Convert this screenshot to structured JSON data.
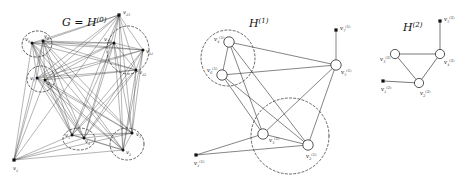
{
  "figure": {
    "type": "graph-coarsening-diagram",
    "panel_count": 3,
    "background": "#ffffff",
    "ink_color": "#1a1a1a"
  },
  "panels": [
    {
      "id": "panel-0",
      "title": "G = H",
      "title_sup": "(0)",
      "title_full": "G = H^(0)",
      "title_pos": {
        "x": 62,
        "y": 26
      },
      "vertex_count": 13,
      "vertices": [
        {
          "name": "v1",
          "sub": "1",
          "sup": "",
          "x": 14,
          "y": 160,
          "shape": "square",
          "label_dx": -1,
          "label_dy": 10
        },
        {
          "name": "v13",
          "sub": "13",
          "sup": "",
          "x": 119,
          "y": 15,
          "shape": "square",
          "label_dx": 4,
          "label_dy": -1
        },
        {
          "name": "v10",
          "sub": "10",
          "sup": "",
          "x": 114,
          "y": 43,
          "shape": "dot",
          "label_dx": -10,
          "label_dy": -2
        },
        {
          "name": "v11",
          "sub": "11",
          "sup": "",
          "x": 143,
          "y": 50,
          "shape": "dot",
          "label_dx": 3,
          "label_dy": 3
        },
        {
          "name": "v12",
          "sub": "12",
          "sup": "",
          "x": 136,
          "y": 70,
          "shape": "dot",
          "label_dx": 3,
          "label_dy": 4
        },
        {
          "name": "v9",
          "sub": "9",
          "sup": "",
          "x": 32,
          "y": 43,
          "shape": "dot",
          "label_dx": -7,
          "label_dy": -2
        },
        {
          "name": "v8",
          "sub": "8",
          "sup": "",
          "x": 43,
          "y": 41,
          "shape": "dot",
          "label_dx": 1,
          "label_dy": -3
        },
        {
          "name": "v7",
          "sub": "7",
          "sup": "",
          "x": 37,
          "y": 78,
          "shape": "dot",
          "label_dx": -7,
          "label_dy": 2
        },
        {
          "name": "v6",
          "sub": "6",
          "sup": "",
          "x": 45,
          "y": 80,
          "shape": "dot",
          "label_dx": 2,
          "label_dy": 5
        },
        {
          "name": "v5",
          "sub": "5",
          "sup": "",
          "x": 72,
          "y": 135,
          "shape": "dot",
          "label_dx": -7,
          "label_dy": 2
        },
        {
          "name": "v4",
          "sub": "4",
          "sup": "",
          "x": 84,
          "y": 138,
          "shape": "dot",
          "label_dx": 1,
          "label_dy": 5
        },
        {
          "name": "v3",
          "sub": "3",
          "sup": "",
          "x": 132,
          "y": 133,
          "shape": "dot",
          "label_dx": 4,
          "label_dy": 3
        },
        {
          "name": "v2",
          "sub": "2",
          "sup": "",
          "x": 123,
          "y": 150,
          "shape": "dot",
          "label_dx": 3,
          "label_dy": 4
        }
      ],
      "clusters": [
        {
          "name": "cluster-top-left",
          "cx": 37,
          "cy": 44,
          "rx": 15,
          "ry": 13,
          "rot": -10,
          "members": [
            "v9",
            "v8"
          ]
        },
        {
          "name": "cluster-bottom-left",
          "cx": 41,
          "cy": 79,
          "rx": 14,
          "ry": 13,
          "rot": 0,
          "members": [
            "v7",
            "v6"
          ]
        },
        {
          "name": "cluster-top-right",
          "cx": 128,
          "cy": 50,
          "rx": 21,
          "ry": 24,
          "rot": 0,
          "members": [
            "v10",
            "v11",
            "v12"
          ]
        },
        {
          "name": "cluster-bottom-mid",
          "cx": 79,
          "cy": 139,
          "rx": 16,
          "ry": 11,
          "rot": 0,
          "members": [
            "v5",
            "v4"
          ]
        },
        {
          "name": "cluster-bottom-right",
          "cx": 127,
          "cy": 144,
          "rx": 17,
          "ry": 16,
          "rot": 0,
          "members": [
            "v3",
            "v2"
          ]
        }
      ],
      "edge_style": "dense-thin-dark",
      "edge_note": "near-complete graph among the 12 upper vertices; v1 connects to the cluster hubs"
    },
    {
      "id": "panel-1",
      "title": "H",
      "title_sup": "(1)",
      "title_full": "H^(1)",
      "title_pos": {
        "x": 249,
        "y": 27
      },
      "vertex_count": 7,
      "vertices": [
        {
          "name": "v1",
          "sub": "1",
          "sup": "(1)",
          "x": 196,
          "y": 155,
          "shape": "square",
          "label_dx": -2,
          "label_dy": 10
        },
        {
          "name": "v2",
          "sub": "2",
          "sup": "(1)",
          "x": 308,
          "y": 145,
          "shape": "open",
          "label_dx": -2,
          "label_dy": 13
        },
        {
          "name": "v3",
          "sub": "3",
          "sup": "(1)",
          "x": 263,
          "y": 134,
          "shape": "open",
          "label_dx": 6,
          "label_dy": 8
        },
        {
          "name": "v4",
          "sub": "4",
          "sup": "(1)",
          "x": 229,
          "y": 42,
          "shape": "open",
          "label_dx": -15,
          "label_dy": -1
        },
        {
          "name": "v5",
          "sub": "5",
          "sup": "(1)",
          "x": 336,
          "y": 65,
          "shape": "open",
          "label_dx": 5,
          "label_dy": 9
        },
        {
          "name": "v6",
          "sub": "6",
          "sup": "(1)",
          "x": 222,
          "y": 75,
          "shape": "open",
          "label_dx": -15,
          "label_dy": -3
        },
        {
          "name": "v7",
          "sub": "7",
          "sup": "(1)",
          "x": 336,
          "y": 30,
          "shape": "square",
          "label_dx": 4,
          "label_dy": 0
        }
      ],
      "clusters": [
        {
          "name": "cluster-left",
          "cx": 228,
          "cy": 58,
          "rx": 27,
          "ry": 28,
          "rot": 0,
          "members": [
            "v4",
            "v6"
          ]
        },
        {
          "name": "cluster-lower",
          "cx": 290,
          "cy": 136,
          "rx": 39,
          "ry": 38,
          "rot": 0,
          "members": [
            "v3",
            "v2"
          ]
        }
      ],
      "edges": [
        [
          "v4",
          "v6"
        ],
        [
          "v4",
          "v5"
        ],
        [
          "v4",
          "v3"
        ],
        [
          "v4",
          "v2"
        ],
        [
          "v6",
          "v5"
        ],
        [
          "v6",
          "v3"
        ],
        [
          "v6",
          "v2"
        ],
        [
          "v5",
          "v3"
        ],
        [
          "v5",
          "v2"
        ],
        [
          "v5",
          "v7"
        ],
        [
          "v3",
          "v2"
        ],
        [
          "v3",
          "v1"
        ],
        [
          "v1",
          "v2"
        ]
      ],
      "edge_style": "thin-straight"
    },
    {
      "id": "panel-2",
      "title": "H",
      "title_sup": "(2)",
      "title_full": "H^(2)",
      "title_pos": {
        "x": 403,
        "y": 31
      },
      "vertex_count": 5,
      "vertices": [
        {
          "name": "v1",
          "sub": "1",
          "sup": "(2)",
          "x": 383,
          "y": 81,
          "shape": "square",
          "label_dx": -2,
          "label_dy": 10
        },
        {
          "name": "v2",
          "sub": "2",
          "sup": "(2)",
          "x": 419,
          "y": 83,
          "shape": "open",
          "label_dx": 1,
          "label_dy": 12
        },
        {
          "name": "v3",
          "sub": "3",
          "sup": "(2)",
          "x": 395,
          "y": 54,
          "shape": "open",
          "label_dx": -15,
          "label_dy": 7
        },
        {
          "name": "v4",
          "sub": "4",
          "sup": "(2)",
          "x": 440,
          "y": 54,
          "shape": "open",
          "label_dx": 4,
          "label_dy": 10
        },
        {
          "name": "v5",
          "sub": "5",
          "sup": "(2)",
          "x": 440,
          "y": 21,
          "shape": "square",
          "label_dx": 4,
          "label_dy": 0
        }
      ],
      "clusters": [],
      "edges": [
        [
          "v3",
          "v4"
        ],
        [
          "v3",
          "v2"
        ],
        [
          "v2",
          "v4"
        ],
        [
          "v1",
          "v2"
        ],
        [
          "v4",
          "v5"
        ]
      ],
      "edge_style": "medium-gray"
    }
  ]
}
